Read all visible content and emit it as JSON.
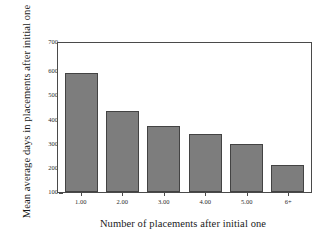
{
  "chart_data": {
    "type": "bar",
    "title": "",
    "subtitle": "",
    "xlabel": "Number of placements after initial one",
    "ylabel": "Mean average days in placements after initial one",
    "categories": [
      "1.00",
      "2.00",
      "3.00",
      "4.00",
      "5.00",
      "6+"
    ],
    "values": [
      580,
      425,
      365,
      332,
      292,
      210
    ],
    "ylim": [
      100,
      700
    ],
    "yticks": [
      100,
      200,
      300,
      400,
      500,
      600,
      700
    ],
    "ytick_labels": [
      "100",
      "200",
      "300",
      "400",
      "500",
      "600",
      "700"
    ],
    "grid": false,
    "legend": false,
    "legend_position": "none",
    "colors": {
      "bar_fill": "#7d7d7d",
      "bar_edge": "#434343",
      "axis": "#4a4a4a",
      "text": "#1a1a1a",
      "background": "#ffffff"
    }
  }
}
